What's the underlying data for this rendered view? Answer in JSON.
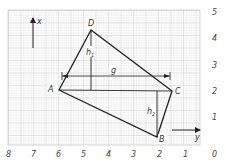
{
  "diagram": {
    "type": "quadrilateral on grid paper",
    "colors": {
      "grid_minor": "#d4d4d4",
      "grid_major": "#b8b8b8",
      "line": "#222222",
      "text": "#333333"
    },
    "points": {
      "A": {
        "label": "A",
        "x": 6,
        "y": 2
      },
      "B": {
        "label": "B",
        "x": 2,
        "y": 0.3
      },
      "C": {
        "label": "C",
        "x": 1.1,
        "y": 2
      },
      "D": {
        "label": "D",
        "x": 4.7,
        "y": 4.3
      }
    },
    "segments": [
      "A-D",
      "D-C",
      "C-B",
      "B-A",
      "A-C"
    ],
    "measure_labels": {
      "g": "g",
      "h1": "h",
      "h1_sub": "1",
      "h2": "h",
      "h2_sub": "2"
    },
    "axes": {
      "x_axis_label": "x",
      "y_axis_label": "y",
      "bottom_ticks": [
        "8",
        "7",
        "6",
        "5",
        "4",
        "3",
        "2",
        "1",
        "0"
      ],
      "right_ticks": [
        "5",
        "4",
        "3",
        "2",
        "1",
        "0"
      ]
    }
  }
}
